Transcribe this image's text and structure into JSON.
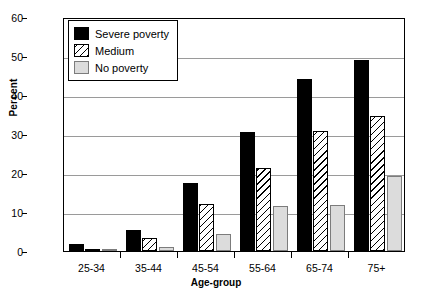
{
  "chart_data": {
    "type": "bar",
    "title": "",
    "xlabel": "Age-group",
    "ylabel": "Percent",
    "categories": [
      "25-34",
      "35-44",
      "45-54",
      "55-64",
      "65-74",
      "75+"
    ],
    "ylim": [
      0,
      60
    ],
    "yticks": [
      0,
      10,
      20,
      30,
      40,
      50,
      60
    ],
    "grid": true,
    "legend_position": "top-left",
    "series": [
      {
        "name": "Severe poverty",
        "pattern": "solid-black",
        "color": "#000000",
        "values": [
          1.7,
          5.5,
          17.5,
          30.5,
          44.0,
          49.0
        ]
      },
      {
        "name": "Medium",
        "pattern": "diagonal-hatch",
        "color": "#ffffff",
        "values": [
          0.4,
          3.4,
          12.0,
          21.2,
          30.7,
          34.5
        ]
      },
      {
        "name": "No poverty",
        "pattern": "light-gray",
        "color": "#dcdcdc",
        "values": [
          0.4,
          1.0,
          4.4,
          11.6,
          11.8,
          19.3
        ]
      }
    ]
  },
  "legend": {
    "entries": [
      {
        "label": "Severe poverty"
      },
      {
        "label": "Medium"
      },
      {
        "label": "No poverty"
      }
    ]
  }
}
